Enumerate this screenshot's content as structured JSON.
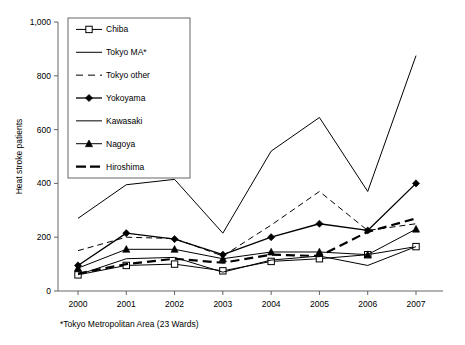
{
  "figure": {
    "footnote": "*Tokyo Metropolitan Area (23 Wards)"
  },
  "chart_data": {
    "type": "line",
    "title": "",
    "xlabel": "",
    "ylabel": "Heat stroke patients",
    "categories": [
      "2000",
      "2001",
      "2002",
      "2003",
      "2004",
      "2005",
      "2006",
      "2007"
    ],
    "xtick_labels": [
      "2000",
      "2001",
      "2002",
      "2003",
      "2004",
      "2005",
      "2006",
      "2007"
    ],
    "ytick_labels": [
      "0",
      "200",
      "400",
      "600",
      "800",
      "1,000"
    ],
    "ytick_values": [
      0,
      200,
      400,
      600,
      800,
      1000
    ],
    "ylim": [
      0,
      1000
    ],
    "grid": false,
    "legend_position": "upper-left-inside",
    "series": [
      {
        "name": "Chiba",
        "marker": "open-square",
        "dash": "none",
        "width": 1,
        "values": [
          60,
          95,
          100,
          75,
          110,
          120,
          135,
          165
        ]
      },
      {
        "name": "Tokyo MA*",
        "marker": "none",
        "dash": "none",
        "width": 1,
        "values": [
          270,
          395,
          415,
          215,
          520,
          645,
          370,
          875
        ]
      },
      {
        "name": "Tokyo other",
        "marker": "none",
        "dash": "dashed",
        "width": 1,
        "values": [
          150,
          200,
          195,
          130,
          245,
          370,
          225,
          250
        ]
      },
      {
        "name": "Yokoyama",
        "marker": "filled-diamond",
        "dash": "none",
        "width": 1.3,
        "values": [
          95,
          215,
          193,
          135,
          200,
          250,
          225,
          400
        ]
      },
      {
        "name": "Kawasaki",
        "marker": "none",
        "dash": "none",
        "width": 1,
        "values": [
          60,
          120,
          125,
          70,
          115,
          130,
          95,
          165
        ]
      },
      {
        "name": "Nagoya",
        "marker": "filled-triangle",
        "dash": "none",
        "width": 1,
        "values": [
          85,
          155,
          155,
          120,
          145,
          145,
          135,
          230
        ]
      },
      {
        "name": "Hiroshima",
        "marker": "none",
        "dash": "bold-dashed",
        "width": 2.2,
        "values": [
          65,
          100,
          120,
          105,
          135,
          130,
          220,
          270
        ]
      }
    ]
  }
}
